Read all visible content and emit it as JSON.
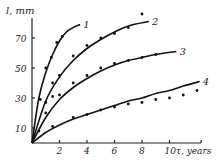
{
  "chart_data": {
    "type": "scatter",
    "title": "",
    "xlabel": "τ, years",
    "ylabel": "l, mm",
    "xlim": [
      0,
      12.3
    ],
    "ylim": [
      0,
      80
    ],
    "x_ticks": [
      2,
      4,
      6,
      8,
      10
    ],
    "y_ticks": [
      10,
      30,
      50,
      70
    ],
    "grid": false,
    "legend": "inline curve labels 1-4 at curve ends",
    "series": [
      {
        "name": "1",
        "points": [
          [
            0.6,
            29
          ],
          [
            1.0,
            50
          ],
          [
            1.4,
            57
          ],
          [
            1.8,
            67
          ],
          [
            2.2,
            71
          ]
        ],
        "curve": [
          [
            0,
            0
          ],
          [
            0.5,
            30
          ],
          [
            1,
            47
          ],
          [
            1.5,
            59
          ],
          [
            2,
            68
          ],
          [
            2.5,
            74
          ],
          [
            3,
            77
          ],
          [
            3.5,
            79
          ]
        ]
      },
      {
        "name": "2",
        "points": [
          [
            1.0,
            27
          ],
          [
            1.5,
            40
          ],
          [
            2.0,
            45
          ],
          [
            3.0,
            58
          ],
          [
            4.0,
            65
          ],
          [
            5.0,
            70
          ],
          [
            6.0,
            73
          ],
          [
            7.0,
            77
          ],
          [
            8.0,
            86
          ]
        ],
        "curve": [
          [
            0,
            0
          ],
          [
            1,
            28
          ],
          [
            2,
            44
          ],
          [
            3,
            55
          ],
          [
            4,
            63
          ],
          [
            5,
            69
          ],
          [
            6,
            74
          ],
          [
            7,
            78
          ],
          [
            8.5,
            81
          ]
        ]
      },
      {
        "name": "3",
        "points": [
          [
            1.0,
            20
          ],
          [
            1.5,
            31
          ],
          [
            2.0,
            32
          ],
          [
            3.0,
            40
          ],
          [
            4.0,
            45
          ],
          [
            5.0,
            50
          ],
          [
            6.0,
            53
          ],
          [
            7.0,
            55
          ],
          [
            8.0,
            57
          ],
          [
            9.0,
            59
          ]
        ],
        "curve": [
          [
            0,
            0
          ],
          [
            1,
            17
          ],
          [
            2,
            29
          ],
          [
            3,
            37
          ],
          [
            4,
            43
          ],
          [
            5,
            48
          ],
          [
            6,
            52
          ],
          [
            7,
            55
          ],
          [
            8,
            57
          ],
          [
            9,
            59
          ],
          [
            10.5,
            61
          ]
        ]
      },
      {
        "name": "4",
        "points": [
          [
            0.5,
            8
          ],
          [
            1.5,
            11
          ],
          [
            3.0,
            17
          ],
          [
            4.0,
            19
          ],
          [
            5.0,
            22
          ],
          [
            6.0,
            24
          ],
          [
            7.0,
            26
          ],
          [
            8.0,
            27
          ],
          [
            9.0,
            29
          ],
          [
            10.0,
            30
          ],
          [
            11.0,
            32
          ],
          [
            12.0,
            35
          ]
        ],
        "curve": [
          [
            0,
            0
          ],
          [
            1,
            7
          ],
          [
            2,
            12
          ],
          [
            3,
            16
          ],
          [
            4,
            19
          ],
          [
            5,
            22
          ],
          [
            6,
            25
          ],
          [
            7,
            28
          ],
          [
            8,
            30
          ],
          [
            9,
            33
          ],
          [
            10,
            35
          ],
          [
            11,
            38
          ],
          [
            12.2,
            41
          ]
        ]
      }
    ]
  },
  "axes": {
    "x_label": "τ, years",
    "y_label": "l, mm",
    "x_tick_labels": [
      "2",
      "4",
      "6",
      "8",
      "10"
    ],
    "y_tick_labels": [
      "10",
      "30",
      "50",
      "70"
    ]
  },
  "curve_labels": [
    "1",
    "2",
    "3",
    "4"
  ]
}
